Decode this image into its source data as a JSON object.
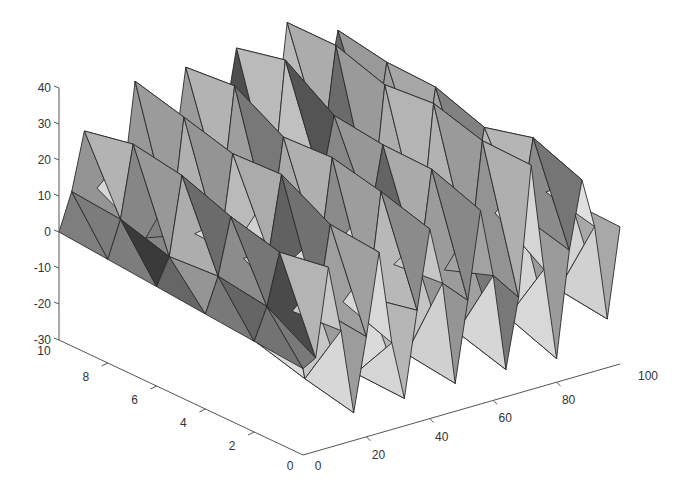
{
  "chart_data": {
    "type": "surface",
    "title": "",
    "xlabel": "",
    "ylabel": "",
    "zlabel": "",
    "x_ticks": [
      0,
      20,
      40,
      60,
      80,
      100
    ],
    "y_ticks": [
      0,
      2,
      4,
      6,
      8,
      10
    ],
    "z_ticks": [
      -30,
      -20,
      -10,
      0,
      10,
      20,
      30,
      40
    ],
    "xlim": [
      0,
      100
    ],
    "ylim": [
      0,
      10
    ],
    "zlim": [
      -30,
      40
    ],
    "grid": false,
    "colormap": "gray",
    "mesh": {
      "nx": 26,
      "ny": 6,
      "seed": 7,
      "sawtooth_period_x": 4,
      "front_trough_z": -26,
      "peak_base_z": 12,
      "peak_gain_x": 0.2,
      "peak_gain_y": 1.2
    }
  },
  "axes": {
    "z_labels": [
      "40",
      "30",
      "20",
      "10",
      "0",
      "-10",
      "-20",
      "-30"
    ],
    "y_labels": [
      "10",
      "8",
      "6",
      "4",
      "2",
      "0"
    ],
    "x_labels": [
      "0",
      "20",
      "40",
      "60",
      "80",
      "100"
    ]
  }
}
